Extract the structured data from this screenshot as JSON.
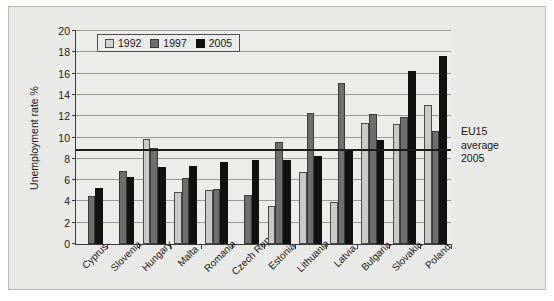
{
  "chart_data": {
    "type": "bar",
    "title": "",
    "xlabel": "",
    "ylabel": "Unemployment rate %",
    "ylim": [
      0,
      20
    ],
    "ytick_step": 2,
    "yticks": [
      0,
      2,
      4,
      6,
      8,
      10,
      12,
      14,
      16,
      18,
      20
    ],
    "grid": "horizontal",
    "legend_position": "top-left-inside",
    "categories": [
      "Cyprus",
      "Slovenia",
      "Hungary",
      "Malta",
      "Romania",
      "Czech Rep",
      "Estonia",
      "Lithuania",
      "Latvia",
      "Bulgaria",
      "Slovakia",
      "Poland"
    ],
    "series": [
      {
        "name": "1992",
        "color": "#d3d3d0",
        "values": [
          null,
          null,
          9.9,
          4.9,
          5.1,
          null,
          3.6,
          6.8,
          3.9,
          11.4,
          11.3,
          13.1
        ]
      },
      {
        "name": "1997",
        "color": "#6e6e6e",
        "values": [
          4.5,
          6.9,
          9.0,
          6.2,
          5.2,
          4.6,
          9.6,
          12.3,
          15.1,
          12.2,
          11.9,
          10.6
        ]
      },
      {
        "name": "2005",
        "color": "#111111",
        "values": [
          5.3,
          6.3,
          7.2,
          7.3,
          7.7,
          7.9,
          7.9,
          8.3,
          8.9,
          9.8,
          16.2,
          17.7
        ]
      }
    ],
    "annotations": [
      {
        "name": "eu15-average-line",
        "value": 8.7,
        "label_lines": [
          "EU15",
          "average",
          "2005"
        ]
      }
    ]
  },
  "legend": {
    "items": [
      {
        "label": "1992"
      },
      {
        "label": "1997"
      },
      {
        "label": "2005"
      }
    ]
  },
  "annotation": {
    "line1": "EU15",
    "line2": "average",
    "line3": "2005"
  }
}
